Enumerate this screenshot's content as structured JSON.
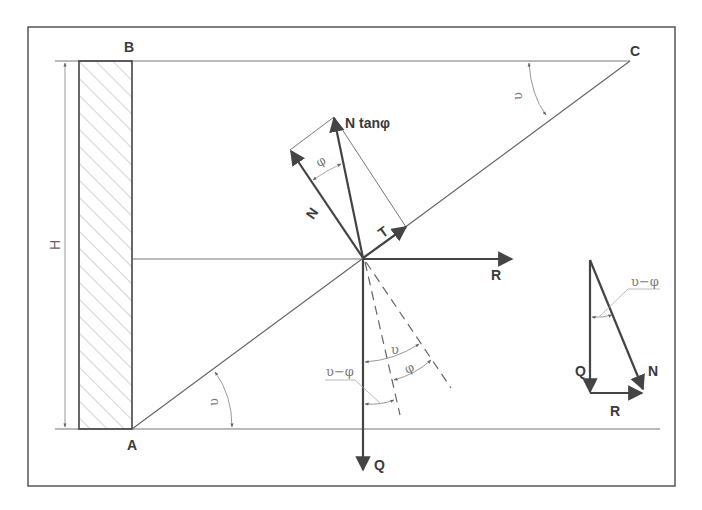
{
  "diagram": {
    "colors": {
      "line": "#555555",
      "thin": "#888888",
      "hatch": "#aaaaaa",
      "text": "#3a3a3a",
      "greek": "#7a7a7a"
    },
    "points": {
      "A": "A",
      "B": "B",
      "C": "C"
    },
    "dimension": {
      "height": "H"
    },
    "forces": {
      "N": "N",
      "N_tan_phi": "N tanφ",
      "T": "T",
      "R": "R",
      "Q": "Q"
    },
    "angles": {
      "upsilon_at_A": "υ",
      "upsilon_at_C": "υ",
      "phi_top": "φ",
      "upsilon_bottom": "υ",
      "phi_bottom": "φ",
      "upsilon_minus_phi_bottom": "υ−φ",
      "upsilon_minus_phi_triangle": "υ−φ"
    },
    "force_triangle": {
      "Q": "Q",
      "R": "R",
      "N": "N",
      "angle": "υ−φ"
    }
  }
}
